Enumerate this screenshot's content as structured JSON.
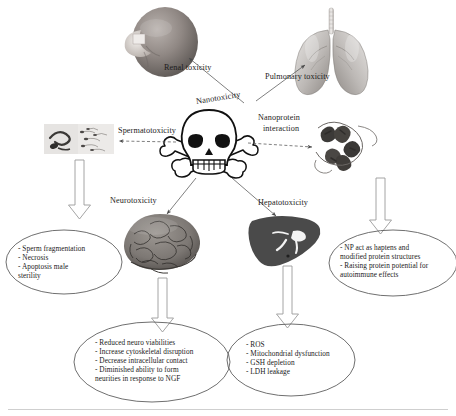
{
  "diagram": {
    "title": "Nanotoxicity",
    "type": "radial-concept-map",
    "center": {
      "label": "Nanotoxicity",
      "icon": "skull-and-crossbones-icon"
    },
    "accent_color": "#1a1a1a",
    "background_color": "#ffffff"
  },
  "branches": [
    {
      "id": "renal",
      "label": "Renal toxicity",
      "organ": "kidney",
      "icon": "kidney-icon",
      "direction": "upper-left"
    },
    {
      "id": "pulmonary",
      "label": "Pulmonary toxicity",
      "organ": "lungs",
      "icon": "lungs-icon",
      "direction": "upper-right"
    },
    {
      "id": "spermato",
      "label": "Spermatotoxicity",
      "organ": "sperm",
      "icon": "sperm-micrograph-icon",
      "direction": "left"
    },
    {
      "id": "nanoprotein",
      "label_line1": "Nanoprotein",
      "label_line2": "interaction",
      "organ": "protein",
      "icon": "protein-ribbon-icon",
      "direction": "right"
    },
    {
      "id": "neuro",
      "label": "Neurotoxicity",
      "organ": "brain",
      "icon": "brain-icon",
      "direction": "lower-left"
    },
    {
      "id": "hepato",
      "label": "Hepatotoxicity",
      "organ": "liver",
      "icon": "liver-icon",
      "direction": "lower-right"
    }
  ],
  "outcomes": [
    {
      "id": "spermato-outcome",
      "source": "spermato",
      "shape": "ellipse",
      "items": [
        "- Sperm fragmentation",
        "- Necrosis",
        "- Apoptosis male",
        "  sterility"
      ]
    },
    {
      "id": "neuro-outcome",
      "source": "neuro",
      "shape": "ellipse",
      "items": [
        "- Reduced neuro viabilities",
        "- Increase cytoskeletal disruption",
        "- Decrease intracellular contact",
        "- Diminished ability to form",
        "  neurities in response to NGF"
      ]
    },
    {
      "id": "hepato-outcome",
      "source": "hepato",
      "shape": "ellipse",
      "items": [
        "- ROS",
        "- Mitochondrial dysfunction",
        "- GSH depletion",
        "- LDH leakage"
      ]
    },
    {
      "id": "nanoprotein-outcome",
      "source": "nanoprotein",
      "shape": "ellipse",
      "items": [
        "- NP act as haptens and",
        "  modified protein structures",
        "- Raising protein potential for",
        "  autoimmune effects"
      ]
    }
  ]
}
